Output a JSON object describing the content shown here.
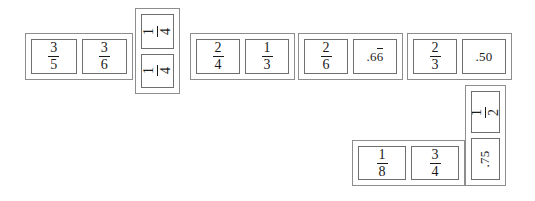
{
  "scene": {
    "title": "Fraction and decimal domino chain",
    "background_color": "#ffffff",
    "frame_color": "#8d8d8d",
    "cell_border_color": "#6f6f6f",
    "text_color": "#1a1a1a"
  },
  "dominoes": [
    {
      "id": "domino-1",
      "orientation": "horizontal",
      "cells": [
        {
          "type": "fraction",
          "numerator": "3",
          "denominator": "5",
          "text": "3/5"
        },
        {
          "type": "fraction",
          "numerator": "3",
          "denominator": "6",
          "text": "3/6"
        }
      ]
    },
    {
      "id": "domino-2",
      "orientation": "vertical",
      "cells": [
        {
          "type": "fraction",
          "numerator": "1",
          "denominator": "4",
          "text": "1/4"
        },
        {
          "type": "fraction",
          "numerator": "1",
          "denominator": "4",
          "text": "1/4"
        }
      ]
    },
    {
      "id": "domino-3",
      "orientation": "horizontal",
      "cells": [
        {
          "type": "fraction",
          "numerator": "2",
          "denominator": "4",
          "text": "2/4"
        },
        {
          "type": "fraction",
          "numerator": "1",
          "denominator": "3",
          "text": "1/3"
        }
      ]
    },
    {
      "id": "domino-4",
      "orientation": "horizontal",
      "cells": [
        {
          "type": "fraction",
          "numerator": "2",
          "denominator": "6",
          "text": "2/6"
        },
        {
          "type": "decimal",
          "prefix": ".6",
          "repeating": "6",
          "text": ".66"
        }
      ]
    },
    {
      "id": "domino-5",
      "orientation": "horizontal",
      "cells": [
        {
          "type": "fraction",
          "numerator": "2",
          "denominator": "3",
          "text": "2/3"
        },
        {
          "type": "decimal",
          "prefix": ".50",
          "repeating": "",
          "text": ".50"
        }
      ]
    },
    {
      "id": "domino-6",
      "orientation": "vertical",
      "cells": [
        {
          "type": "fraction",
          "numerator": "1",
          "denominator": "2",
          "text": "1/2"
        },
        {
          "type": "decimal",
          "prefix": ".75",
          "repeating": "",
          "text": ".75"
        }
      ]
    },
    {
      "id": "domino-7",
      "orientation": "horizontal",
      "cells": [
        {
          "type": "fraction",
          "numerator": "1",
          "denominator": "8",
          "text": "1/8"
        },
        {
          "type": "fraction",
          "numerator": "3",
          "denominator": "4",
          "text": "3/4"
        }
      ]
    }
  ]
}
